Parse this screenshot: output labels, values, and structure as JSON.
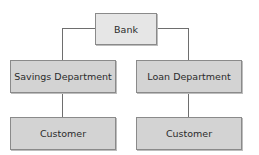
{
  "diagram": {
    "type": "org-chart",
    "root": {
      "label": "Bank"
    },
    "departments": [
      {
        "label": "Savings Department",
        "child": {
          "label": "Customer"
        }
      },
      {
        "label": "Loan Department",
        "child": {
          "label": "Customer"
        }
      }
    ]
  },
  "colors": {
    "root_fill": "#e6e6e6",
    "node_fill": "#d3d3d3",
    "border": "#8a8a8a",
    "connector": "#6e6e6e"
  }
}
